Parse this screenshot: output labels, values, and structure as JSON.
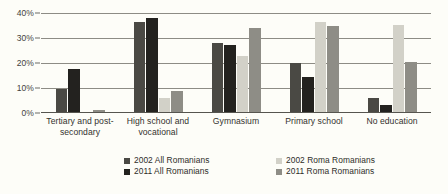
{
  "chart_data": {
    "type": "bar",
    "title": "",
    "subtitle": "",
    "xlabel": "",
    "ylabel": "",
    "ylim": [
      0,
      40
    ],
    "yticks": [
      "0%",
      "10%",
      "20%",
      "30%",
      "40%"
    ],
    "ytick_values": [
      0,
      10,
      20,
      30,
      40
    ],
    "grid": true,
    "legend_position": "bottom",
    "categories": [
      "Tertiary and post-secondary",
      "High school and vocational",
      "Gymnasium",
      "Primary school",
      "No education"
    ],
    "category_lines": [
      [
        "Tertiary and post-",
        "secondary"
      ],
      [
        "High school and",
        "vocational"
      ],
      [
        "Gymnasium"
      ],
      [
        "Primary school"
      ],
      [
        "No education"
      ]
    ],
    "series": [
      {
        "name": "2002 All Romanians",
        "color": "#4a4944",
        "values": [
          9.8,
          36.4,
          28.0,
          20.0,
          6.0
        ]
      },
      {
        "name": "2011 All Romanians",
        "color": "#23221f",
        "values": [
          17.6,
          38.2,
          27.4,
          14.4,
          3.1
        ]
      },
      {
        "name": "2002 Roma Romanians",
        "color": "#d2d1c8",
        "values": [
          0.5,
          6.0,
          23.0,
          36.5,
          35.2
        ]
      },
      {
        "name": "2011 Roma Romanians",
        "color": "#8e8d86",
        "values": [
          1.1,
          9.0,
          34.0,
          34.8,
          20.6
        ]
      }
    ]
  },
  "legend": {
    "items": [
      {
        "label": "2002 All Romanians",
        "color": "#4a4944"
      },
      {
        "label": "2011 All Romanians",
        "color": "#23221f"
      },
      {
        "label": "2002 Roma Romanians",
        "color": "#d2d1c8"
      },
      {
        "label": "2011 Roma Romanians",
        "color": "#8e8d86"
      }
    ]
  },
  "colors": {
    "background": "#fdfdf8",
    "gridline": "#8d8c85",
    "axis": "#56554f",
    "text": "#2e2d29"
  }
}
